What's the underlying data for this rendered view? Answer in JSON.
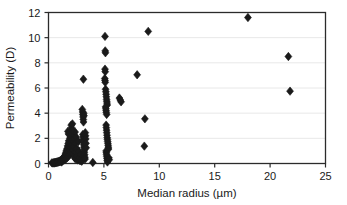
{
  "chart_data": {
    "type": "scatter",
    "title": "",
    "xlabel": "Median radius (µm)",
    "ylabel": "Permeability (D)",
    "xlim": [
      0,
      25
    ],
    "ylim": [
      0,
      12
    ],
    "xticks": [
      0,
      5,
      10,
      15,
      20,
      25
    ],
    "yticks": [
      0,
      2,
      4,
      6,
      8,
      10,
      12
    ],
    "xtick_labels": [
      "0",
      "5",
      "10",
      "15",
      "20",
      "25"
    ],
    "ytick_labels": [
      "0",
      "2",
      "4",
      "6",
      "8",
      "10",
      "12"
    ],
    "grid": "horizontal",
    "grid_color": "#e8e8e8",
    "marker": "diamond",
    "marker_color": "#1a1a1a",
    "marker_size": 4.2,
    "legend": null,
    "series": [
      {
        "name": "samples",
        "points": [
          [
            0.3,
            0.05
          ],
          [
            0.38,
            0.04
          ],
          [
            0.45,
            0.06
          ],
          [
            0.5,
            0.03
          ],
          [
            0.55,
            0.08
          ],
          [
            0.6,
            0.05
          ],
          [
            0.65,
            0.1
          ],
          [
            0.7,
            0.07
          ],
          [
            0.75,
            0.12
          ],
          [
            0.8,
            0.09
          ],
          [
            0.85,
            0.15
          ],
          [
            0.9,
            0.11
          ],
          [
            0.95,
            0.18
          ],
          [
            1.0,
            0.14
          ],
          [
            1.05,
            0.22
          ],
          [
            1.1,
            0.17
          ],
          [
            1.15,
            0.26
          ],
          [
            1.18,
            0.12
          ],
          [
            1.2,
            0.3
          ],
          [
            1.25,
            0.2
          ],
          [
            1.28,
            0.4
          ],
          [
            1.3,
            0.25
          ],
          [
            1.35,
            0.35
          ],
          [
            1.38,
            0.5
          ],
          [
            1.4,
            0.28
          ],
          [
            1.45,
            0.45
          ],
          [
            1.48,
            0.62
          ],
          [
            1.5,
            0.33
          ],
          [
            1.52,
            0.75
          ],
          [
            1.55,
            0.55
          ],
          [
            1.58,
            0.9
          ],
          [
            1.6,
            0.4
          ],
          [
            1.62,
            1.05
          ],
          [
            1.65,
            0.68
          ],
          [
            1.68,
            1.2
          ],
          [
            1.7,
            0.48
          ],
          [
            1.72,
            1.4
          ],
          [
            1.75,
            0.82
          ],
          [
            1.78,
            1.6
          ],
          [
            1.8,
            0.58
          ],
          [
            1.82,
            1.8
          ],
          [
            1.85,
            0.95
          ],
          [
            1.88,
            1.3
          ],
          [
            1.9,
            0.7
          ],
          [
            1.92,
            2.0
          ],
          [
            1.95,
            1.1
          ],
          [
            1.96,
            1.5
          ],
          [
            1.98,
            0.85
          ],
          [
            2.0,
            2.2
          ],
          [
            2.02,
            1.25
          ],
          [
            2.05,
            1.7
          ],
          [
            2.08,
            0.95
          ],
          [
            2.1,
            2.4
          ],
          [
            2.12,
            1.45
          ],
          [
            2.15,
            1.9
          ],
          [
            2.18,
            1.15
          ],
          [
            2.2,
            2.6
          ],
          [
            2.22,
            1.05
          ],
          [
            2.25,
            0.75
          ],
          [
            2.28,
            2.3
          ],
          [
            2.3,
            1.35
          ],
          [
            2.32,
            0.55
          ],
          [
            2.35,
            1.95
          ],
          [
            2.38,
            0.42
          ],
          [
            2.4,
            2.5
          ],
          [
            2.42,
            1.6
          ],
          [
            2.45,
            0.9
          ],
          [
            2.48,
            0.35
          ],
          [
            2.5,
            2.1
          ],
          [
            2.55,
            1.2
          ],
          [
            2.6,
            0.6
          ],
          [
            2.65,
            0.28
          ],
          [
            2.7,
            1.75
          ],
          [
            2.75,
            0.95
          ],
          [
            2.8,
            0.45
          ],
          [
            2.85,
            0.22
          ],
          [
            2.9,
            0.7
          ],
          [
            2.95,
            0.35
          ],
          [
            3.0,
            0.18
          ],
          [
            2.05,
            3.05
          ],
          [
            2.08,
            2.85
          ],
          [
            2.12,
            2.65
          ],
          [
            2.16,
            3.15
          ],
          [
            1.75,
            2.55
          ],
          [
            1.8,
            2.35
          ],
          [
            3.05,
            4.3
          ],
          [
            3.08,
            4.1
          ],
          [
            3.1,
            3.9
          ],
          [
            3.12,
            3.7
          ],
          [
            3.14,
            3.5
          ],
          [
            3.16,
            3.3
          ],
          [
            3.18,
            4.0
          ],
          [
            3.2,
            3.8
          ],
          [
            3.1,
            2.3
          ],
          [
            3.12,
            2.1
          ],
          [
            3.14,
            1.9
          ],
          [
            3.16,
            1.7
          ],
          [
            3.18,
            1.5
          ],
          [
            3.2,
            1.3
          ],
          [
            3.22,
            1.1
          ],
          [
            3.24,
            0.9
          ],
          [
            3.26,
            0.7
          ],
          [
            3.28,
            0.5
          ],
          [
            3.3,
            0.35
          ],
          [
            3.32,
            2.45
          ],
          [
            3.34,
            2.2
          ],
          [
            3.36,
            1.95
          ],
          [
            3.38,
            1.6
          ],
          [
            3.4,
            1.25
          ],
          [
            3.15,
            6.7
          ],
          [
            4.0,
            0.08
          ],
          [
            5.1,
            10.1
          ],
          [
            5.12,
            8.95
          ],
          [
            5.14,
            8.8
          ],
          [
            5.1,
            7.5
          ],
          [
            5.12,
            7.3
          ],
          [
            5.08,
            6.75
          ],
          [
            5.1,
            6.6
          ],
          [
            5.12,
            6.45
          ],
          [
            5.15,
            5.9
          ],
          [
            5.18,
            5.7
          ],
          [
            5.2,
            5.5
          ],
          [
            5.22,
            5.3
          ],
          [
            5.24,
            5.1
          ],
          [
            5.26,
            4.95
          ],
          [
            5.28,
            4.8
          ],
          [
            5.3,
            4.65
          ],
          [
            5.15,
            4.5
          ],
          [
            5.18,
            4.35
          ],
          [
            5.2,
            4.2
          ],
          [
            5.22,
            4.05
          ],
          [
            5.25,
            3.9
          ],
          [
            5.2,
            3.05
          ],
          [
            5.22,
            2.85
          ],
          [
            5.24,
            2.65
          ],
          [
            5.26,
            2.45
          ],
          [
            5.28,
            2.25
          ],
          [
            5.3,
            2.05
          ],
          [
            5.32,
            1.9
          ],
          [
            5.34,
            1.75
          ],
          [
            5.36,
            1.6
          ],
          [
            5.38,
            1.45
          ],
          [
            5.4,
            1.3
          ],
          [
            5.42,
            1.15
          ],
          [
            5.2,
            1.0
          ],
          [
            5.22,
            0.85
          ],
          [
            5.24,
            0.7
          ],
          [
            5.26,
            0.55
          ],
          [
            5.28,
            0.4
          ],
          [
            5.3,
            0.25
          ],
          [
            5.32,
            0.12
          ],
          [
            5.45,
            0.45
          ],
          [
            5.48,
            0.3
          ],
          [
            6.4,
            5.2
          ],
          [
            6.48,
            5.05
          ],
          [
            6.55,
            4.9
          ],
          [
            8.0,
            7.05
          ],
          [
            8.7,
            3.55
          ],
          [
            8.65,
            1.38
          ],
          [
            9.0,
            10.5
          ],
          [
            18.0,
            11.6
          ],
          [
            21.65,
            8.5
          ],
          [
            21.8,
            5.75
          ]
        ]
      }
    ]
  },
  "axes": {
    "x_axis_title": "Median radius (µm)",
    "y_axis_title": "Permeability (D)"
  }
}
